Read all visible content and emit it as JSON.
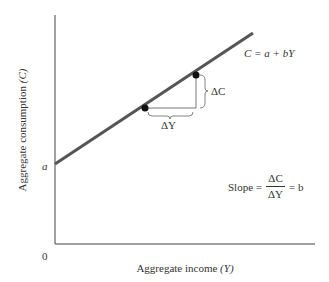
{
  "diagram": {
    "y_axis_label": "Aggregate consumption",
    "y_axis_symbol": "(C)",
    "x_axis_label": "Aggregate income",
    "x_axis_symbol": "(Y)",
    "origin_label": "0",
    "intercept_label": "a",
    "line_equation": "C = a + bY",
    "delta_c_label": "ΔC",
    "delta_y_label": "ΔY",
    "slope_label": "Slope =",
    "slope_numerator": "ΔC",
    "slope_denominator": "ΔY",
    "slope_result": "= b",
    "colors": {
      "line": "#555555",
      "axes": "#444444",
      "points": "#111111",
      "text": "#333333"
    }
  }
}
